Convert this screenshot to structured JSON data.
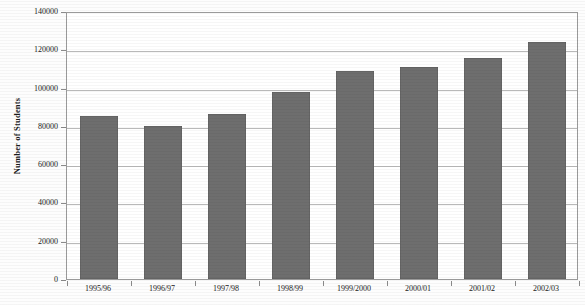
{
  "chart_data": {
    "type": "bar",
    "title": "",
    "xlabel": "",
    "ylabel": "Number of Students",
    "categories": [
      "1995/96",
      "1996/97",
      "1997/98",
      "1998/99",
      "1999/2000",
      "2000/01",
      "2001/02",
      "2002/03"
    ],
    "values": [
      85000,
      80000,
      86000,
      97500,
      108500,
      111000,
      115500,
      124000
    ],
    "ylim": [
      0,
      140000
    ],
    "ytick_labels": [
      "0",
      "20000",
      "40000",
      "60000",
      "80000",
      "100000",
      "120000",
      "140000"
    ],
    "ytick_values": [
      0,
      20000,
      40000,
      60000,
      80000,
      100000,
      120000,
      140000
    ],
    "grid": true,
    "legend": "none",
    "bar_color": "#6e6e6e",
    "gridline_color": "#b9b9b9",
    "frame_color": "#9a9a9a",
    "background_color": "#ffffff"
  }
}
